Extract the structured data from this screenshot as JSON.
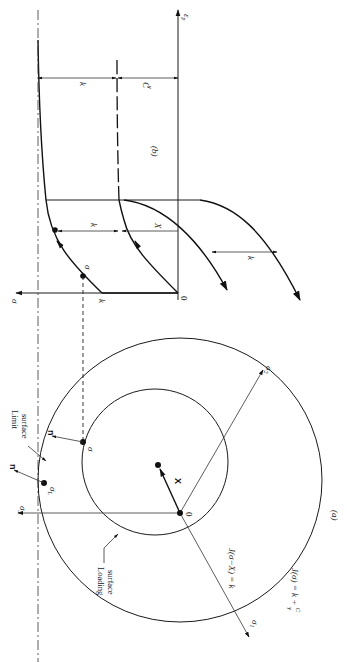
{
  "figure": {
    "orientation": "rotated 90 degrees clockwise",
    "panel_a": {
      "caption": "(a)",
      "axes": {
        "sigma1": "σ",
        "sigma1_sub": "1",
        "sigma2": "σ",
        "sigma2_sub": "2",
        "sigma3": "σ",
        "sigma3_sub": "3"
      },
      "origin_label": "0",
      "back_stress_label": "X",
      "loading_surface_equation": "J(σ−X) = k",
      "limit_surface_equation_prefix": "J(σ) = k + ",
      "limit_surface_equation_frac_num": "C",
      "limit_surface_equation_frac_den": "γ",
      "loading_surface_label_line1": "Loading",
      "loading_surface_label_line2": "surface",
      "limit_surface_label_line1": "Limit",
      "limit_surface_label_line2": "surface",
      "stress_point_label": "σ",
      "limit_point_label": "σ",
      "limit_point_sub": "L",
      "normal_label": "n",
      "normal_label_2": "n"
    },
    "panel_b": {
      "caption": "(b)",
      "x_axis_label": "ε",
      "x_axis_sub": "p",
      "y_axis_label": "σ",
      "origin_label": "0",
      "yield_label": "k",
      "stress_point_label": "σ",
      "dim_k_1": "k",
      "dim_X": "X",
      "dim_k_2": "k",
      "dim_k_top": "k",
      "dim_C_num": "C",
      "dim_C_den": "γ"
    }
  }
}
